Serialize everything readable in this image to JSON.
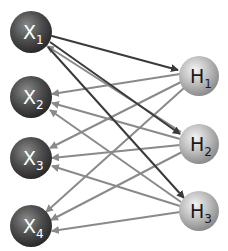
{
  "diagram": {
    "type": "bipartite-network",
    "colors": {
      "input_node": "#505050",
      "hidden_node": "#b8b8b8",
      "dark_edge": "#3a3a3a",
      "light_edge": "#8a8a8a",
      "input_label": "#ffffff",
      "hidden_label": "#1a1a1a"
    },
    "input_nodes": [
      {
        "id": "x1",
        "base": "X",
        "sub": "1",
        "cx": 31,
        "cy": 32
      },
      {
        "id": "x2",
        "base": "X",
        "sub": "2",
        "cx": 31,
        "cy": 97
      },
      {
        "id": "x3",
        "base": "X",
        "sub": "3",
        "cx": 31,
        "cy": 158
      },
      {
        "id": "x4",
        "base": "X",
        "sub": "4",
        "cx": 31,
        "cy": 226
      }
    ],
    "hidden_nodes": [
      {
        "id": "h1",
        "base": "H",
        "sub": "1",
        "cx": 199,
        "cy": 76
      },
      {
        "id": "h2",
        "base": "H",
        "sub": "2",
        "cx": 199,
        "cy": 144
      },
      {
        "id": "h3",
        "base": "H",
        "sub": "3",
        "cx": 199,
        "cy": 211
      }
    ]
  }
}
